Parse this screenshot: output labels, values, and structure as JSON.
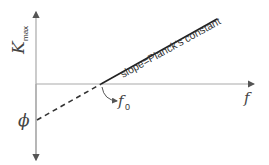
{
  "diagram": {
    "y_axis_label": {
      "main": "K",
      "subscript": "max"
    },
    "x_axis_label": "f",
    "intercept_label": "ϕ",
    "threshold_label": {
      "main": "f",
      "subscript": "0"
    },
    "line_annotation": "slope=Planck's constant",
    "colors": {
      "axis": "#a9a9a9",
      "line": "#222222",
      "text": "#444444"
    }
  }
}
